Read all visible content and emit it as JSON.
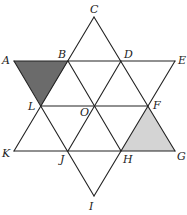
{
  "diagram": {
    "colors": {
      "line": "#222222",
      "dark_shade": "#6b6b6b",
      "light_shade": "#d4d4d4",
      "background": "#ffffff"
    },
    "points": [
      {
        "id": "C",
        "x": 94,
        "y": 17,
        "label": "C",
        "lx": 90,
        "ly": 13
      },
      {
        "id": "A",
        "x": 14,
        "y": 61,
        "label": "A",
        "lx": 2,
        "ly": 64
      },
      {
        "id": "B",
        "x": 68,
        "y": 61,
        "label": "B",
        "lx": 58,
        "ly": 58
      },
      {
        "id": "D",
        "x": 121,
        "y": 61,
        "label": "D",
        "lx": 124,
        "ly": 58
      },
      {
        "id": "E",
        "x": 175,
        "y": 61,
        "label": "E",
        "lx": 178,
        "ly": 64
      },
      {
        "id": "L",
        "x": 41,
        "y": 106,
        "label": "L",
        "lx": 28,
        "ly": 110
      },
      {
        "id": "O",
        "x": 94,
        "y": 106,
        "label": "O",
        "lx": 80,
        "ly": 116
      },
      {
        "id": "F",
        "x": 148,
        "y": 106,
        "label": "F",
        "lx": 153,
        "ly": 109
      },
      {
        "id": "K",
        "x": 14,
        "y": 151,
        "label": "K",
        "lx": 2,
        "ly": 157
      },
      {
        "id": "J",
        "x": 68,
        "y": 151,
        "label": "J",
        "lx": 60,
        "ly": 163
      },
      {
        "id": "H",
        "x": 121,
        "y": 151,
        "label": "H",
        "lx": 123,
        "ly": 163
      },
      {
        "id": "G",
        "x": 175,
        "y": 151,
        "label": "G",
        "lx": 177,
        "ly": 160
      },
      {
        "id": "I",
        "x": 94,
        "y": 196,
        "label": "I",
        "lx": 89,
        "ly": 210
      }
    ],
    "segments": [
      [
        "A",
        "E"
      ],
      [
        "L",
        "F"
      ],
      [
        "K",
        "G"
      ],
      [
        "C",
        "K"
      ],
      [
        "C",
        "G"
      ],
      [
        "I",
        "A"
      ],
      [
        "I",
        "E"
      ],
      [
        "B",
        "H"
      ],
      [
        "D",
        "J"
      ]
    ],
    "shaded_regions": [
      {
        "name": "triangle-ABL",
        "vertices": [
          "A",
          "B",
          "L"
        ],
        "shade": "dark_shade"
      },
      {
        "name": "triangle-FHG",
        "vertices": [
          "F",
          "H",
          "G"
        ],
        "shade": "light_shade"
      }
    ]
  }
}
